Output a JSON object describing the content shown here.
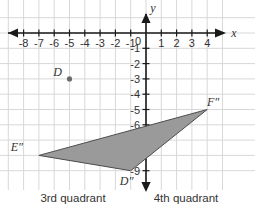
{
  "figure": {
    "title_axes": {
      "x_axis_label": "x",
      "y_axis_label": "y"
    },
    "grid": {
      "line_color": "#d8d8d8",
      "background": "#ffffff",
      "unit_px": 15.3,
      "origin_px": {
        "x": 146,
        "y": 33
      }
    },
    "axes": {
      "color": "#1a1a1a",
      "x_range": [
        -9,
        5
      ],
      "y_range": [
        -9.6,
        1.2
      ],
      "x_ticks": [
        -8,
        -7,
        -6,
        -5,
        -4,
        -3,
        -2,
        -1,
        1,
        2,
        3,
        4
      ],
      "x_tick_labels": [
        "-8",
        "-7",
        "-6",
        "-5",
        "-4",
        "-3",
        "-2",
        "-1",
        "1",
        "2",
        "3",
        "4"
      ],
      "y_ticks": [
        -1,
        -2,
        -3,
        -4,
        -5,
        -6,
        -7,
        -8,
        -9
      ],
      "y_tick_labels": [
        "-1",
        "-2",
        "-3",
        "-4",
        "-5",
        "-6",
        "-7",
        "-8",
        "-9"
      ],
      "origin_label": "0"
    },
    "points": [
      {
        "name": "D",
        "label": "D",
        "x": -5,
        "y": -3,
        "marker": "dot",
        "marker_color": "#6b6b6b",
        "label_dx": -12,
        "label_dy": -3
      }
    ],
    "triangle": {
      "name": "triangle-DEF-double-prime",
      "fill": "#9a9a9a",
      "stroke": "#4d4d4d",
      "vertices": [
        {
          "label": "E″",
          "x": -7,
          "y": -8,
          "label_dx": -22,
          "label_dy": -4
        },
        {
          "label": "F″",
          "x": 4,
          "y": -5,
          "label_dx": 6,
          "label_dy": -4
        },
        {
          "label": "D″",
          "x": -1,
          "y": -9,
          "label_dx": -4,
          "label_dy": 14
        }
      ]
    },
    "captions": {
      "left": "3rd quadrant",
      "right": "4th quadrant"
    }
  }
}
